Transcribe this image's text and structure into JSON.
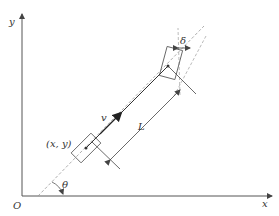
{
  "diagram": {
    "labels": {
      "y_axis": "y",
      "x_axis": "x",
      "origin": "O",
      "heading_angle": "θ",
      "rear_position": "(x, y)",
      "velocity": "v",
      "wheelbase": "L",
      "steering_angle": "δ"
    },
    "colors": {
      "stroke": "#555555",
      "dashed": "#999999",
      "text": "#333333",
      "background": "#ffffff"
    }
  }
}
